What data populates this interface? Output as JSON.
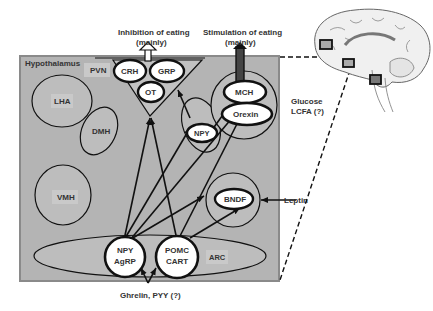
{
  "title_inhibition": [
    "Inhibition of eating",
    "(mainly)"
  ],
  "title_stimulation": [
    "Stimulation of eating",
    "(mainly)"
  ],
  "hypothalamus": {
    "label": "Hypothalamus",
    "regions": {
      "pvn": "PVN",
      "lha": "LHA",
      "dmh": "DMH",
      "vmh": "VMH",
      "arc": "ARC"
    }
  },
  "neurons": {
    "crh": "CRH",
    "grp": "GRP",
    "ot": "OT",
    "mch": "MCH",
    "orexin": "Orexin",
    "npy_dmh": "NPY",
    "bndf": "BNDF",
    "npy_agrp": [
      "NPY",
      "AgRP"
    ],
    "pomc_cart": [
      "POMC",
      "CART"
    ]
  },
  "inputs": {
    "glucose": [
      "Glucose",
      "LCFA (?)"
    ],
    "leptin": "Leptin",
    "ghrelin": "Ghrelin, PYY (?)"
  },
  "colors": {
    "box_fill": "#b4b4b4",
    "box_border": "#8a8a8a",
    "region_fill": "#bdbdbd",
    "node_fill": "#ffffff",
    "stroke": "#111111"
  }
}
